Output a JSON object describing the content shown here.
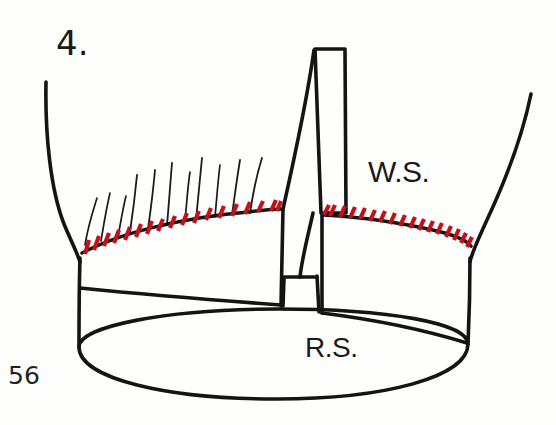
{
  "figure": {
    "step_number": "4.",
    "page_number": "56",
    "labels": {
      "wrong_side": "W.S.",
      "right_side": "R.S."
    },
    "colors": {
      "ink": "#141414",
      "stitch_red": "#C1121C",
      "paper": "#FEFEFD"
    },
    "outline": {
      "left_arm": "M 46,82 C 44,140 52,200 70,243 C 78,262 80,275 80,288",
      "right_arm": "M 531,94 C 520,140 497,200 476,243 C 468,262 466,275 466,288",
      "left_rim": "M 81,246 C 130,226 200,213 282,210",
      "right_rim": "M 322,212 C 390,216 440,227 474,243",
      "body_left_side": "M 80,249 L 79,347",
      "body_right_side": "M 474,246 L 468,344",
      "inner_left_shelf": "M 80,288 C 150,296 226,302 281,305",
      "inner_right_shelf": "M 321,312 C 380,318 430,330 466,342",
      "ellipse_base": "M 79,347 C 79,378 168,398 276,398 C 384,398 468,377 468,344 C 468,324 390,310 280,310 C 170,310 79,326 79,347",
      "center_post_left": "M 282,210 L 281,305 L 283,277 L 316,277",
      "center_cap": "M 314,48 L 345,48 L 345,212 L 314,212 Z",
      "center_diagonal_left": "M 314,48 L 282,210",
      "center_diagonal_inner": "M 320,212 L 310,280 L 318,312",
      "post_foot_left": "M 283,277 L 316,277",
      "post_stem_left": "M 283,277 L 281,305",
      "post_stem_right": "M 316,277 L 321,312"
    },
    "stitch_marks": {
      "left_section_count": 17,
      "right_section_count": 16,
      "description": "red slanted tick marks along rim edges"
    },
    "bristles": {
      "count": 11,
      "description": "thin black fanned strands above left rim"
    }
  }
}
